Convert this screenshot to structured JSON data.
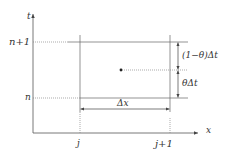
{
  "axes": {
    "y_label": "t",
    "x_label": "x"
  },
  "time_levels": {
    "upper": "n+1",
    "lower": "n"
  },
  "space_nodes": {
    "left": "j",
    "right": "j+1"
  },
  "dimensions": {
    "dx": "Δx",
    "upper_part": "(1−θ)Δt",
    "lower_part": "θΔt"
  },
  "colors": {
    "line": "#555555",
    "text": "#333333"
  }
}
